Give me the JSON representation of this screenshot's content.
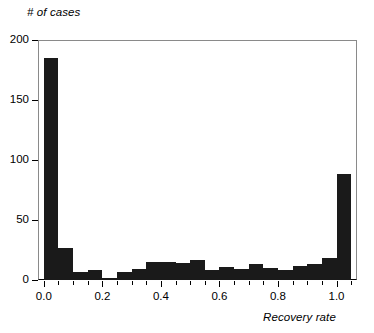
{
  "chart_data": {
    "type": "bar",
    "title": "",
    "subtitle": "",
    "xlabel": "Recovery rate",
    "ylabel": "# of cases",
    "grid": false,
    "legend": null,
    "bin_width": 0.05,
    "xlim": [
      -0.02,
      1.07
    ],
    "ylim": [
      0,
      200
    ],
    "xticks": [
      "0.0",
      "0.2",
      "0.4",
      "0.6",
      "0.8",
      "1.0"
    ],
    "xtick_values": [
      0.0,
      0.2,
      0.4,
      0.6,
      0.8,
      1.0
    ],
    "yticks": [
      "0",
      "50",
      "100",
      "150",
      "200"
    ],
    "ytick_values": [
      0,
      50,
      100,
      150,
      200
    ],
    "bar_color": "#1a1a1a",
    "categories": [
      "0.00",
      "0.05",
      "0.10",
      "0.15",
      "0.20",
      "0.25",
      "0.30",
      "0.35",
      "0.40",
      "0.45",
      "0.50",
      "0.55",
      "0.60",
      "0.65",
      "0.70",
      "0.75",
      "0.80",
      "0.85",
      "0.90",
      "0.95",
      "1.00"
    ],
    "bin_starts": [
      0.0,
      0.05,
      0.1,
      0.15,
      0.2,
      0.25,
      0.3,
      0.35,
      0.4,
      0.45,
      0.5,
      0.55,
      0.6,
      0.65,
      0.7,
      0.75,
      0.8,
      0.85,
      0.9,
      0.95,
      1.0
    ],
    "values": [
      185,
      27,
      7,
      8,
      2,
      7,
      9,
      15,
      15,
      14,
      17,
      8,
      11,
      9,
      13,
      10,
      8,
      12,
      13,
      18,
      88
    ]
  },
  "axes": {
    "y_title": "# of cases",
    "x_title": "Recovery rate"
  }
}
